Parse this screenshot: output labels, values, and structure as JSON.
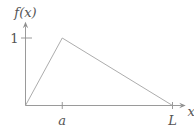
{
  "figure": {
    "background_color": "#ffffff",
    "axis_color": "#8f8f8f",
    "curve_color": "#a3a3a3",
    "text_color": "#555555"
  },
  "chart_data": {
    "type": "line",
    "title": "",
    "xlabel": "x",
    "ylabel": "f(x)",
    "series": [
      {
        "name": "f(x)",
        "points": [
          [
            0,
            0
          ],
          [
            0.25,
            1
          ],
          [
            1,
            0
          ]
        ],
        "points_symbolic": [
          "(0, 0)",
          "(a, 1)",
          "(L, 0)"
        ]
      }
    ],
    "x_ticks": [
      {
        "value": 0.25,
        "label": "a"
      },
      {
        "value": 1.0,
        "label": "L"
      }
    ],
    "y_ticks": [
      {
        "value": 1.0,
        "label": "1"
      }
    ],
    "xlim": [
      0,
      1.09
    ],
    "ylim": [
      0,
      1.24
    ],
    "grid": false,
    "legend": false
  }
}
